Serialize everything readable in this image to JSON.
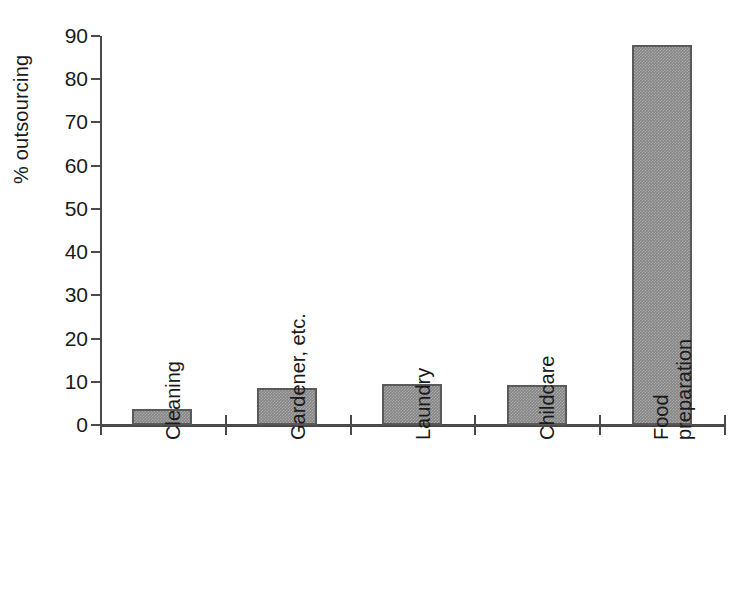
{
  "chart_data": {
    "type": "bar",
    "title": "",
    "subtitle": "",
    "xlabel": "",
    "ylabel": "% outsourcing",
    "categories": [
      "Cleaning",
      "Gardener, etc.",
      "Laundry",
      "Childcare",
      "Food\npreparation"
    ],
    "values": [
      3.7,
      8.6,
      9.4,
      9.2,
      88
    ],
    "ylim": [
      0,
      90
    ],
    "ytick_labels": [
      "90",
      "80",
      "70",
      "60",
      "50",
      "40",
      "30",
      "20",
      "10",
      "0"
    ],
    "ytick_values": [
      90,
      80,
      70,
      60,
      50,
      40,
      30,
      20,
      10,
      0
    ],
    "grid": false,
    "legend": false,
    "legend_position": "none",
    "bar_color": "#848484",
    "bar_edge_color": "#5a5a5a",
    "axis_color": "#4a4a4a",
    "background_color": "#ffffff",
    "annotations": []
  }
}
